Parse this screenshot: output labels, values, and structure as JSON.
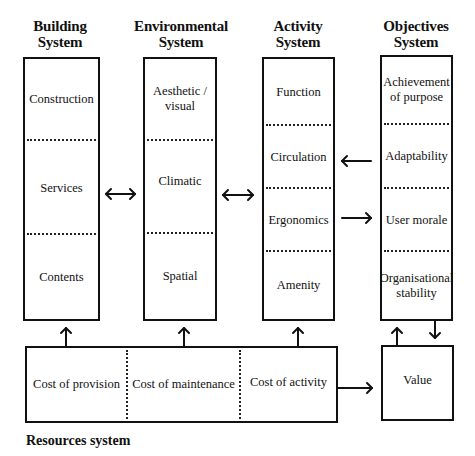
{
  "diagram": {
    "columns": [
      {
        "id": "building",
        "title_line1": "Building",
        "title_line2": "System",
        "cells": [
          "Construction",
          "Services",
          "Contents"
        ]
      },
      {
        "id": "environmental",
        "title_line1": "Environmental",
        "title_line2": "System",
        "cells": [
          "Aesthetic / visual",
          "Climatic",
          "Spatial"
        ]
      },
      {
        "id": "activity",
        "title_line1": "Activity",
        "title_line2": "System",
        "cells": [
          "Function",
          "Circulation",
          "Ergonomics",
          "Amenity"
        ]
      },
      {
        "id": "objectives",
        "title_line1": "Objectives",
        "title_line2": "System",
        "cells": [
          "Achievement of purpose",
          "Adaptability",
          "User morale",
          "Organisational stability"
        ]
      }
    ],
    "resources": {
      "label": "Resources system",
      "cells": [
        "Cost of provision",
        "Cost of maintenance",
        "Cost of activity"
      ]
    },
    "value_box": {
      "label": "Value"
    },
    "connections": [
      {
        "from": "building",
        "to": "environmental",
        "type": "bidirectional"
      },
      {
        "from": "environmental",
        "to": "activity",
        "type": "bidirectional"
      },
      {
        "from": "objectives.Adaptability",
        "to": "activity.Circulation",
        "type": "directed"
      },
      {
        "from": "activity.Ergonomics",
        "to": "objectives.User morale",
        "type": "directed"
      },
      {
        "from": "resources.Cost of provision",
        "to": "building",
        "type": "directed"
      },
      {
        "from": "resources.Cost of maintenance",
        "to": "environmental",
        "type": "directed"
      },
      {
        "from": "resources.Cost of activity",
        "to": "activity",
        "type": "directed"
      },
      {
        "from": "resources",
        "to": "value",
        "type": "directed"
      },
      {
        "from": "value",
        "to": "objectives",
        "type": "directed"
      },
      {
        "from": "objectives",
        "to": "value",
        "type": "directed"
      }
    ],
    "colors": {
      "line": "#111111",
      "background": "#ffffff"
    }
  }
}
